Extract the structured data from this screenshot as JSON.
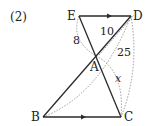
{
  "problem_number": "(2)",
  "points": {
    "E": {
      "label": "E",
      "x": 79,
      "y": 16
    },
    "D": {
      "label": "D",
      "x": 131,
      "y": 16
    },
    "A": {
      "label": "A",
      "x": 96,
      "y": 56
    },
    "B": {
      "label": "B",
      "x": 43,
      "y": 117
    },
    "C": {
      "label": "C",
      "x": 121,
      "y": 117
    }
  },
  "measurements": {
    "EA": "8",
    "AD": "10",
    "DC": "25",
    "AC": "x"
  },
  "parallel_segments": [
    "ED",
    "BC"
  ],
  "colors": {
    "stroke": "#2a2a2a",
    "dotted": "#9a9a9a",
    "text": "#222222"
  }
}
